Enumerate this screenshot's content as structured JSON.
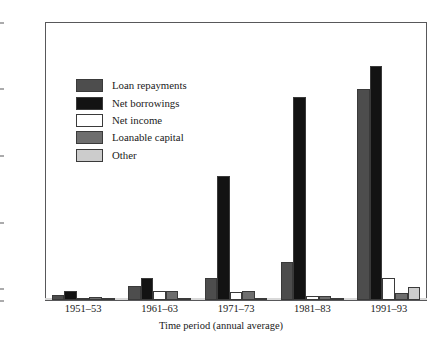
{
  "chart_data": {
    "type": "bar",
    "title": "",
    "xlabel": "Time period (annual average)",
    "ylabel": "",
    "categories": [
      "1951–53",
      "1961–63",
      "1971–73",
      "1981–83",
      "1991–93"
    ],
    "ylim": [
      1000,
      11000
    ],
    "yticks": [
      1000,
      1400,
      3800,
      6200,
      8600,
      11000
    ],
    "ytick_labels": [
      "1000",
      "1400",
      "3800",
      "6200",
      "8600",
      "11,000"
    ],
    "grid": false,
    "legend_position": "upper-left-inside",
    "series": [
      {
        "name": "Loan repayments",
        "color": "#4d4d4d",
        "values": [
          1170,
          1500,
          1800,
          2350,
          8600
        ]
      },
      {
        "name": "Net borrowings",
        "color": "#131313",
        "values": [
          1330,
          1780,
          5450,
          8300,
          9400
        ]
      },
      {
        "name": "Net income",
        "color": "#ffffff",
        "values": [
          1050,
          1330,
          1290,
          1130,
          1800
        ]
      },
      {
        "name": "Loanable capital",
        "color": "#6e6e6e",
        "values": [
          1120,
          1310,
          1330,
          1150,
          1260
        ]
      },
      {
        "name": "Other",
        "color": "#cccccc",
        "values": [
          1040,
          1040,
          1040,
          1040,
          1470
        ]
      }
    ]
  },
  "axis": {
    "y_tick_labels": [
      "11,000",
      "8600",
      "6200",
      "3800",
      "1400",
      "1000"
    ],
    "x_tick_labels": [
      "1951–53",
      "1961–63",
      "1971–73",
      "1981–83",
      "1991–93"
    ],
    "x_title": "Time period (annual average)"
  },
  "legend": {
    "items": [
      {
        "label": "Loan repayments",
        "color": "#4d4d4d"
      },
      {
        "label": "Net borrowings",
        "color": "#131313"
      },
      {
        "label": "Net income",
        "color": "#ffffff"
      },
      {
        "label": "Loanable capital",
        "color": "#6e6e6e"
      },
      {
        "label": "Other",
        "color": "#cccccc"
      }
    ]
  },
  "colors": {
    "frame": "#58585a",
    "bar_edge": "#3a3a3a",
    "background": "#ffffff",
    "text": "#1a1a1a"
  }
}
